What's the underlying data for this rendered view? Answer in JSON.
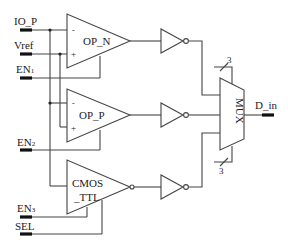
{
  "diagram": {
    "type": "circuit-schematic",
    "inputs": [
      {
        "id": "io_p",
        "label": "IO_P"
      },
      {
        "id": "vref",
        "label": "Vref"
      },
      {
        "id": "en1",
        "label": "EN",
        "sub": "1"
      },
      {
        "id": "en2",
        "label": "EN",
        "sub": "2"
      },
      {
        "id": "en3",
        "label": "EN",
        "sub": "3"
      },
      {
        "id": "sel",
        "label": "SEL"
      }
    ],
    "outputs": [
      {
        "id": "d_in",
        "label": "D_in"
      }
    ],
    "blocks": {
      "op_n": {
        "label": "OP_N",
        "minus": "-",
        "plus": "+"
      },
      "op_p": {
        "label": "OP_P",
        "minus": "-",
        "plus": "+"
      },
      "cmos_ttl": {
        "label_line1": "CMOS",
        "label_line2": "_TTL"
      },
      "mux": {
        "label": "MUX"
      }
    },
    "buses": [
      {
        "id": "bus_top",
        "width": "3"
      },
      {
        "id": "bus_bottom",
        "width": "3"
      }
    ],
    "inverters": [
      "inv1",
      "inv2",
      "inv3"
    ],
    "colors": {
      "line": "#444444",
      "pin": "#111111",
      "background": "#ffffff"
    }
  }
}
